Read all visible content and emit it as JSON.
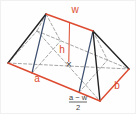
{
  "figure": {
    "type": "geometry-diagram",
    "labels": {
      "ridge": "w",
      "height": "h",
      "base_front": "a",
      "base_right": "b",
      "center_mark": "×",
      "offset_numerator": "a − w",
      "offset_denominator": "2"
    },
    "colors": {
      "highlight_red": "#dd4a2f",
      "solid_edge_black": "#232323",
      "section_line_navy": "#3e5070",
      "hidden_edge_gray": "#9b9b9b",
      "fraction_text": "#3c3c3c",
      "background": "#fefefe"
    }
  }
}
